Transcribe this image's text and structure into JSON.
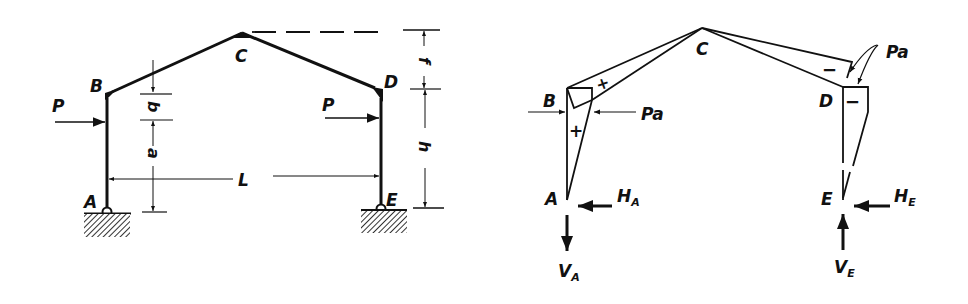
{
  "figure": {
    "left": {
      "title": "Three-hinged gable frame with loads",
      "nodes": {
        "A": "A",
        "B": "B",
        "C": "C",
        "D": "D",
        "E": "E"
      },
      "loads": {
        "left_P": "P",
        "right_P": "P"
      },
      "dimensions": {
        "b": "b",
        "a": "a",
        "L": "L",
        "f": "f",
        "h": "h"
      },
      "supports": [
        "hinged-support-A",
        "hinged-support-E"
      ]
    },
    "right": {
      "title": "Bending moment diagram",
      "nodes": {
        "A": "A",
        "B": "B",
        "C": "C",
        "D": "D",
        "E": "E"
      },
      "moment_labels": {
        "left": "Pa",
        "right": "Pa"
      },
      "signs": {
        "BC": "+",
        "AB": "+",
        "CD": "−",
        "DE": "−"
      },
      "reactions": {
        "HA": "H",
        "HA_sub": "A",
        "VA": "V",
        "VA_sub": "A",
        "HE": "H",
        "HE_sub": "E",
        "VE": "V",
        "VE_sub": "E"
      }
    }
  }
}
